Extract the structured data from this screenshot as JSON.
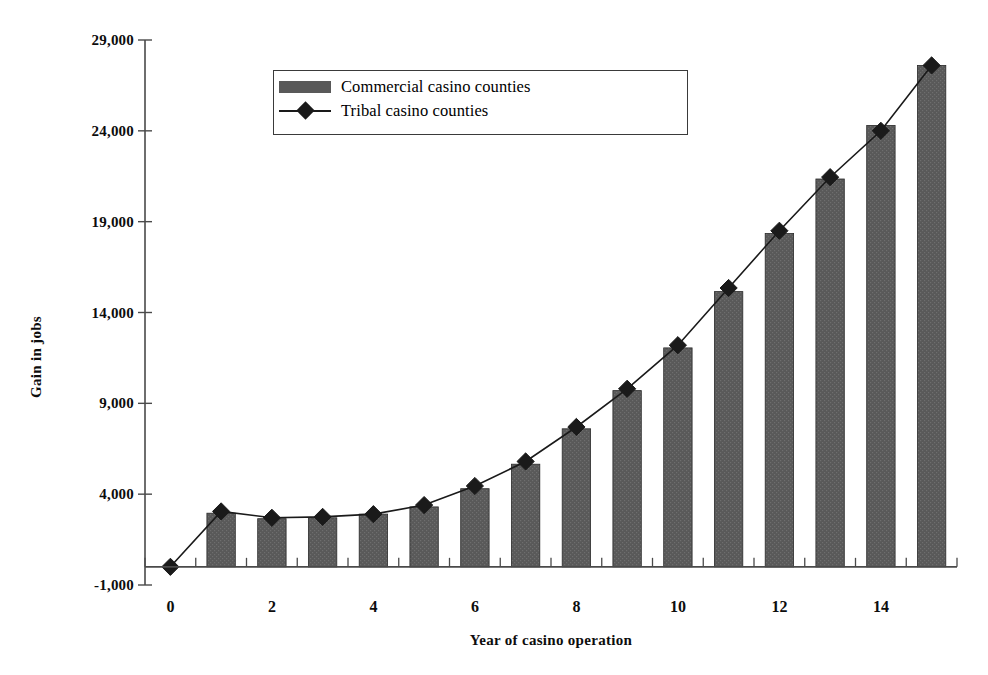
{
  "chart_data": {
    "type": "bar",
    "title": "",
    "subtitle": "",
    "xlabel": "Year of casino operation",
    "ylabel": "Gain in jobs",
    "categories": [
      0,
      1,
      2,
      3,
      4,
      5,
      6,
      7,
      8,
      9,
      10,
      11,
      12,
      13,
      14,
      15
    ],
    "x": [
      0,
      1,
      2,
      3,
      4,
      5,
      6,
      7,
      8,
      9,
      10,
      11,
      12,
      13,
      14,
      15
    ],
    "xlim": [
      -0.5,
      15.5
    ],
    "ylim": [
      -1000,
      29000
    ],
    "yticks": [
      -1000,
      4000,
      9000,
      14000,
      19000,
      24000,
      29000
    ],
    "ytick_labels": [
      "-1,000",
      "4,000",
      "9,000",
      "14,000",
      "19,000",
      "24,000",
      "29,000"
    ],
    "xticks": [
      0,
      1,
      2,
      3,
      4,
      5,
      6,
      7,
      8,
      9,
      10,
      11,
      12,
      13,
      14,
      15
    ],
    "xtick_labels_shown": [
      "0",
      "2",
      "4",
      "6",
      "8",
      "10",
      "12",
      "14"
    ],
    "xtick_labels_shown_values": [
      0,
      2,
      4,
      6,
      8,
      10,
      12,
      14
    ],
    "grid": false,
    "legend_position": "top-center",
    "series": [
      {
        "name": "Commercial casino counties",
        "type": "bar",
        "color": "#595959",
        "values": [
          0,
          2950,
          2650,
          2700,
          2900,
          3300,
          4300,
          5650,
          7600,
          9700,
          12050,
          15150,
          18350,
          21350,
          24300,
          27600
        ]
      },
      {
        "name": "Tribal casino counties",
        "type": "line",
        "marker": "diamond",
        "color": "#1a1a1a",
        "values": [
          0,
          3050,
          2700,
          2750,
          2900,
          3400,
          4450,
          5800,
          7700,
          9800,
          12200,
          15350,
          18500,
          21450,
          24000,
          27600
        ]
      }
    ]
  },
  "legend": {
    "items": [
      {
        "label": "Commercial casino counties",
        "marker": "bar-swatch"
      },
      {
        "label": "Tribal casino counties",
        "marker": "line-diamond"
      }
    ]
  },
  "axes": {
    "y_title": "Gain in jobs",
    "x_title": "Year of casino operation"
  }
}
